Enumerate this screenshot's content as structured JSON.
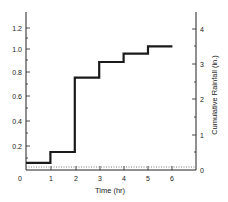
{
  "chart_data": {
    "type": "line",
    "style": "step",
    "title": "",
    "xlabel": "Time (hr)",
    "ylabel_left": "",
    "ylabel_right": "Cumulative Rainfall (in.)",
    "x_ticks": [
      "0",
      "1",
      "2",
      "3",
      "4",
      "5",
      "6"
    ],
    "y_left_ticks": [
      "0.2",
      "0.4",
      "0.6",
      "0.8",
      "1.0",
      "1.2"
    ],
    "y_right_ticks": [
      "0",
      "1",
      "2",
      "3",
      "4"
    ],
    "xlim": [
      0,
      7
    ],
    "ylim_left": [
      0,
      1.35
    ],
    "ylim_right": [
      0,
      4.5
    ],
    "grid": false,
    "legend": null,
    "series": [
      {
        "name": "Rainfall step",
        "x": [
          0,
          1,
          1,
          2,
          2,
          3,
          3,
          4,
          4,
          5,
          5,
          6
        ],
        "y": [
          0.06,
          0.06,
          0.15,
          0.15,
          0.77,
          0.77,
          0.9,
          0.9,
          0.97,
          0.97,
          1.03,
          1.03
        ]
      }
    ]
  },
  "labels": {
    "x_origin": "0",
    "right_zero": "0"
  }
}
